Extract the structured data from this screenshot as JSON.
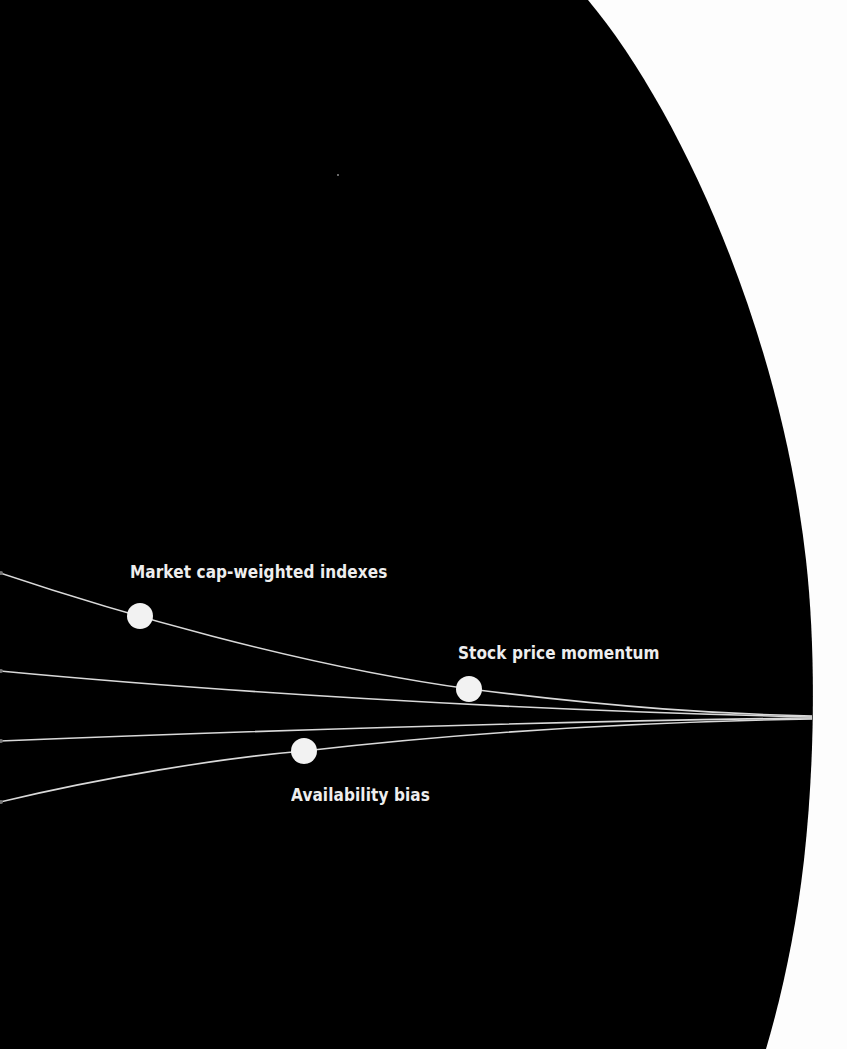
{
  "diagram": {
    "background_color": "#fdfdfd",
    "disc_color": "#000000",
    "line_color": "#d9d9d9",
    "node_color": "#f2f2f2",
    "label_color": "#eeeeee",
    "convergence_point": {
      "x": 812,
      "y": 717
    },
    "lines": [
      {
        "id": "line-1",
        "start": {
          "x": 0,
          "y": 573
        },
        "node_label": "Market cap-weighted indexes"
      },
      {
        "id": "line-2",
        "start": {
          "x": 0,
          "y": 671
        },
        "node_label": "Stock price momentum"
      },
      {
        "id": "line-3",
        "start": {
          "x": 0,
          "y": 741
        },
        "node_label": ""
      },
      {
        "id": "line-4",
        "start": {
          "x": 0,
          "y": 802
        },
        "node_label": "Availability bias"
      }
    ],
    "nodes": [
      {
        "label": "Market cap-weighted indexes",
        "x": 140,
        "y": 616
      },
      {
        "label": "Stock price momentum",
        "x": 469,
        "y": 689
      },
      {
        "label": "Availability bias",
        "x": 304,
        "y": 751
      }
    ]
  },
  "labels": {
    "market_cap": "Market cap-weighted indexes",
    "momentum": "Stock price momentum",
    "availability": "Availability bias"
  }
}
